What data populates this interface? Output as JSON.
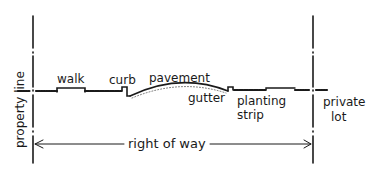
{
  "diagram": {
    "type": "street cross-section",
    "labels": {
      "property_line": "property line",
      "walk": "walk",
      "curb": "curb",
      "pavement": "pavement",
      "gutter": "gutter",
      "planting_strip_1": "planting",
      "planting_strip_2": "strip",
      "private_lot_1": "private",
      "private_lot_2": "lot",
      "right_of_way": "right of way"
    },
    "colors": {
      "ink": "#1a1a1a",
      "background": "#ffffff"
    }
  }
}
